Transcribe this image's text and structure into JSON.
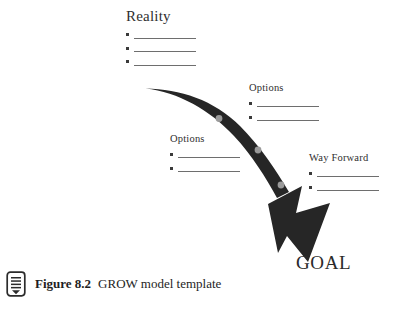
{
  "figure": {
    "background_color": "#ffffff",
    "arrow_color": "#262626",
    "marker_color": "#9a9a9a",
    "rule_color": "#6e6e6e",
    "text_color": "#2b2b2b"
  },
  "reality": {
    "title": "Reality",
    "bullets": [
      "",
      "",
      ""
    ]
  },
  "options_lower_left": {
    "title": "Options",
    "bullets": [
      "",
      ""
    ]
  },
  "options_upper_right": {
    "title": "Options",
    "bullets": [
      "",
      ""
    ]
  },
  "way_forward": {
    "title": "Way Forward",
    "bullets": [
      "",
      ""
    ]
  },
  "goal": {
    "label": "GOAL"
  },
  "caption": {
    "icon": "document-lines-icon",
    "figure_number": "Figure 8.2",
    "title": "GROW model template"
  }
}
